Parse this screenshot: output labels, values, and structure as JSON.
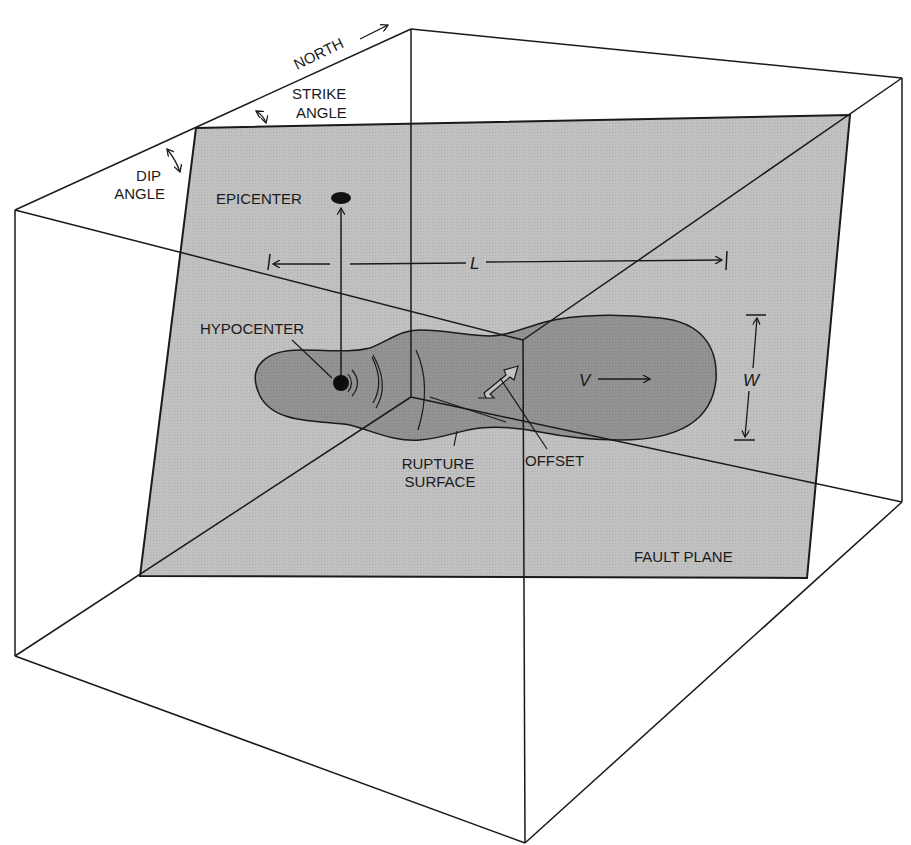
{
  "figure": {
    "colors": {
      "background": "#ffffff",
      "fault_plane": "#bdbdbd",
      "rupture_surface": "#8f8f8f",
      "line": "#1a1a1a"
    }
  },
  "labels": {
    "north": "NORTH",
    "strike_angle_line1": "STRIKE",
    "strike_angle_line2": "ANGLE",
    "dip_angle_line1": "DIP",
    "dip_angle_line2": "ANGLE",
    "epicenter": "EPICENTER",
    "hypocenter": "HYPOCENTER",
    "length": "L",
    "width": "W",
    "velocity": "V",
    "rupture_surface_line1": "RUPTURE",
    "rupture_surface_line2": "SURFACE",
    "offset": "OFFSET",
    "fault_plane": "FAULT PLANE"
  },
  "icons": {
    "north_arrow": "arrow-right-icon",
    "strike_arc": "double-arrow-arc-icon",
    "dip_arc": "double-arrow-arc-icon",
    "offset_arrow": "double-headed-hollow-arrow-icon",
    "velocity_arrow": "arrow-right-icon"
  }
}
